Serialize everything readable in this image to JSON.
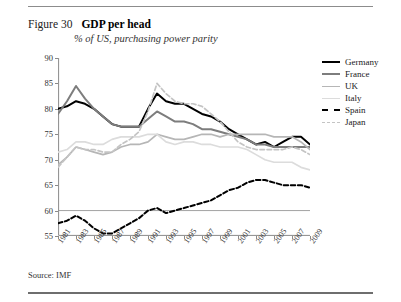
{
  "figure": {
    "number": "Figure 30",
    "title": "GDP per head",
    "subtitle": "% of US, purchasing power parity",
    "source": "Source: IMF"
  },
  "legend": {
    "position": "right",
    "items": [
      {
        "label": "Germany",
        "color": "#000000",
        "style": "solid",
        "width": 2.1
      },
      {
        "label": "France",
        "color": "#7d7d7d",
        "style": "solid",
        "width": 2.1
      },
      {
        "label": "UK",
        "color": "#b6b6b6",
        "style": "solid",
        "width": 1.8
      },
      {
        "label": "Italy",
        "color": "#dcdcdc",
        "style": "solid",
        "width": 1.8
      },
      {
        "label": "Spain",
        "color": "#000000",
        "style": "dashed",
        "width": 2.1
      },
      {
        "label": "Japan",
        "color": "#c4c4c4",
        "style": "dashed",
        "width": 1.8
      }
    ]
  },
  "chart_data": {
    "type": "line",
    "title": "GDP per head",
    "subtitle": "% of US, purchasing power parity",
    "xlabel": "",
    "ylabel": "",
    "ylim": [
      55,
      90
    ],
    "ytick_values": [
      55,
      60,
      65,
      70,
      75,
      80,
      85,
      90
    ],
    "grid": false,
    "x": [
      1981,
      1982,
      1983,
      1984,
      1985,
      1986,
      1987,
      1988,
      1989,
      1990,
      1991,
      1992,
      1993,
      1994,
      1995,
      1996,
      1997,
      1998,
      1999,
      2000,
      2001,
      2002,
      2003,
      2004,
      2005,
      2006,
      2007,
      2008,
      2009
    ],
    "xtick_labels": [
      "1981",
      "1983",
      "1985",
      "1987",
      "1989",
      "1991",
      "1993",
      "1995",
      "1997",
      "1999",
      "2001",
      "2003",
      "2005",
      "2007",
      "2009"
    ],
    "series": [
      {
        "name": "Germany",
        "color": "#000000",
        "style": "solid",
        "values": [
          80.0,
          80.5,
          81.5,
          81.0,
          80.0,
          78.5,
          77.0,
          76.5,
          76.5,
          76.5,
          80.0,
          83.0,
          81.5,
          81.0,
          81.0,
          80.0,
          79.0,
          78.5,
          77.5,
          76.0,
          75.0,
          74.0,
          73.0,
          73.5,
          72.5,
          73.5,
          74.5,
          74.5,
          73.0
        ]
      },
      {
        "name": "France",
        "color": "#7d7d7d",
        "style": "solid",
        "values": [
          79.0,
          81.5,
          84.5,
          82.0,
          80.0,
          78.5,
          77.0,
          76.5,
          76.5,
          76.5,
          78.0,
          79.5,
          78.5,
          77.5,
          77.5,
          77.0,
          76.0,
          76.0,
          75.5,
          75.0,
          74.5,
          74.0,
          73.0,
          73.0,
          72.5,
          72.5,
          72.5,
          72.5,
          72.5
        ]
      },
      {
        "name": "UK",
        "color": "#b6b6b6",
        "style": "solid",
        "values": [
          69.0,
          70.5,
          72.5,
          72.0,
          71.5,
          71.0,
          71.5,
          72.5,
          73.0,
          73.0,
          73.5,
          75.0,
          74.5,
          74.0,
          74.0,
          74.5,
          75.0,
          75.0,
          74.5,
          75.0,
          75.0,
          75.0,
          75.0,
          75.0,
          74.5,
          74.5,
          74.5,
          73.5,
          72.0
        ]
      },
      {
        "name": "Italy",
        "color": "#dcdcdc",
        "style": "solid",
        "values": [
          71.5,
          72.0,
          73.5,
          73.5,
          73.0,
          73.0,
          74.0,
          74.5,
          74.5,
          74.5,
          75.0,
          75.0,
          73.5,
          73.0,
          73.5,
          73.5,
          73.0,
          73.0,
          72.5,
          72.5,
          72.5,
          72.0,
          71.0,
          70.0,
          69.5,
          69.5,
          69.5,
          68.5,
          68.0
        ]
      },
      {
        "name": "Spain",
        "color": "#000000",
        "style": "dashed",
        "values": [
          57.5,
          58.0,
          59.0,
          58.0,
          56.5,
          55.5,
          55.5,
          56.5,
          57.5,
          58.5,
          60.0,
          60.5,
          59.5,
          60.0,
          60.5,
          61.0,
          61.5,
          62.0,
          63.0,
          64.0,
          64.5,
          65.5,
          66.0,
          66.0,
          65.5,
          65.0,
          65.0,
          65.0,
          64.5
        ]
      },
      {
        "name": "Japan",
        "color": "#c4c4c4",
        "style": "dashed",
        "values": [
          68.5,
          70.5,
          72.5,
          72.0,
          72.0,
          71.5,
          71.5,
          73.0,
          74.0,
          75.5,
          79.5,
          85.0,
          83.0,
          81.5,
          81.0,
          81.0,
          80.5,
          79.0,
          77.5,
          75.5,
          73.5,
          72.5,
          72.0,
          72.0,
          72.0,
          72.0,
          72.5,
          72.0,
          71.0
        ]
      }
    ]
  }
}
